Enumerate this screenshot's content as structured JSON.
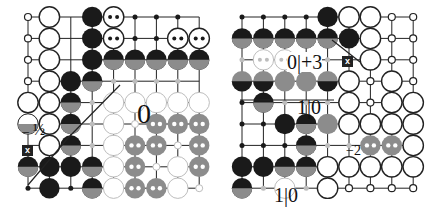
{
  "diagrams": [
    {
      "name": "left-go-diagram",
      "origin": [
        28,
        17
      ],
      "spacing": 21.4,
      "cols": 9,
      "rows": 9,
      "stones": [
        {
          "c": 0,
          "r": 0,
          "t": "wdot"
        },
        {
          "c": 1,
          "r": 0,
          "t": "w"
        },
        {
          "c": 3,
          "r": 0,
          "t": "b"
        },
        {
          "c": 4,
          "r": 0,
          "t": "w2"
        },
        {
          "c": 5,
          "r": 0,
          "t": "bdot"
        },
        {
          "c": 6,
          "r": 0,
          "t": "bdot"
        },
        {
          "c": 7,
          "r": 0,
          "t": "bdot"
        },
        {
          "c": 0,
          "r": 1,
          "t": "wdot"
        },
        {
          "c": 1,
          "r": 1,
          "t": "w"
        },
        {
          "c": 3,
          "r": 1,
          "t": "b"
        },
        {
          "c": 4,
          "r": 1,
          "t": "w2"
        },
        {
          "c": 5,
          "r": 1,
          "t": "bdot"
        },
        {
          "c": 6,
          "r": 1,
          "t": "bdot"
        },
        {
          "c": 7,
          "r": 1,
          "t": "w2"
        },
        {
          "c": 8,
          "r": 1,
          "t": "w2"
        },
        {
          "c": 0,
          "r": 2,
          "t": "wdot"
        },
        {
          "c": 1,
          "r": 2,
          "t": "w"
        },
        {
          "c": 3,
          "r": 2,
          "t": "b"
        },
        {
          "c": 4,
          "r": 2,
          "t": "bg"
        },
        {
          "c": 5,
          "r": 2,
          "t": "bg"
        },
        {
          "c": 6,
          "r": 2,
          "t": "bg"
        },
        {
          "c": 7,
          "r": 2,
          "t": "bg"
        },
        {
          "c": 8,
          "r": 2,
          "t": "bg"
        },
        {
          "c": 0,
          "r": 3,
          "t": "wdot"
        },
        {
          "c": 1,
          "r": 3,
          "t": "w"
        },
        {
          "c": 2,
          "r": 3,
          "t": "b"
        },
        {
          "c": 3,
          "r": 3,
          "t": "bg"
        },
        {
          "c": 4,
          "r": 3,
          "t": "gdot"
        },
        {
          "c": 5,
          "r": 3,
          "t": "gdot"
        },
        {
          "c": 6,
          "r": 3,
          "t": "gdot"
        },
        {
          "c": 7,
          "r": 3,
          "t": "gdot"
        },
        {
          "c": 0,
          "r": 4,
          "t": "w"
        },
        {
          "c": 1,
          "r": 4,
          "t": "w"
        },
        {
          "c": 2,
          "r": 4,
          "t": "bg"
        },
        {
          "c": 3,
          "r": 4,
          "t": "gdot"
        },
        {
          "c": 4,
          "r": 4,
          "t": "lw"
        },
        {
          "c": 5,
          "r": 4,
          "t": "lw"
        },
        {
          "c": 6,
          "r": 4,
          "t": "lw"
        },
        {
          "c": 7,
          "r": 4,
          "t": "lw"
        },
        {
          "c": 8,
          "r": 4,
          "t": "lw"
        },
        {
          "c": 0,
          "r": 5,
          "t": "wg"
        },
        {
          "c": 1,
          "r": 5,
          "t": "w"
        },
        {
          "c": 2,
          "r": 5,
          "t": "bg"
        },
        {
          "c": 3,
          "r": 5,
          "t": "gdot"
        },
        {
          "c": 4,
          "r": 5,
          "t": "lw"
        },
        {
          "c": 5,
          "r": 5,
          "t": "lwdot"
        },
        {
          "c": 6,
          "r": 5,
          "t": "g2"
        },
        {
          "c": 7,
          "r": 5,
          "t": "g2"
        },
        {
          "c": 8,
          "r": 5,
          "t": "g2"
        },
        {
          "c": 1,
          "r": 6,
          "t": "w"
        },
        {
          "c": 2,
          "r": 6,
          "t": "bg"
        },
        {
          "c": 3,
          "r": 6,
          "t": "gdot"
        },
        {
          "c": 4,
          "r": 6,
          "t": "lw"
        },
        {
          "c": 5,
          "r": 6,
          "t": "g2"
        },
        {
          "c": 6,
          "r": 6,
          "t": "g2"
        },
        {
          "c": 7,
          "r": 6,
          "t": "lwdot"
        },
        {
          "c": 8,
          "r": 6,
          "t": "g2"
        },
        {
          "c": 0,
          "r": 7,
          "t": "bg"
        },
        {
          "c": 1,
          "r": 7,
          "t": "b"
        },
        {
          "c": 2,
          "r": 7,
          "t": "b"
        },
        {
          "c": 3,
          "r": 7,
          "t": "bg"
        },
        {
          "c": 4,
          "r": 7,
          "t": "lw"
        },
        {
          "c": 5,
          "r": 7,
          "t": "g2"
        },
        {
          "c": 6,
          "r": 7,
          "t": "lwdot"
        },
        {
          "c": 7,
          "r": 7,
          "t": "lw"
        },
        {
          "c": 8,
          "r": 7,
          "t": "g2"
        },
        {
          "c": 0,
          "r": 8,
          "t": "bdot"
        },
        {
          "c": 1,
          "r": 8,
          "t": "b"
        },
        {
          "c": 2,
          "r": 8,
          "t": "bdot"
        },
        {
          "c": 3,
          "r": 8,
          "t": "bg"
        },
        {
          "c": 4,
          "r": 8,
          "t": "lw"
        },
        {
          "c": 5,
          "r": 8,
          "t": "g2"
        },
        {
          "c": 6,
          "r": 8,
          "t": "g2"
        },
        {
          "c": 7,
          "r": 8,
          "t": "lw"
        },
        {
          "c": 8,
          "r": 8,
          "t": "lwdot"
        }
      ]
    },
    {
      "name": "right-go-diagram",
      "origin": [
        242,
        17
      ],
      "spacing": 21.4,
      "cols": 9,
      "rows": 9,
      "stones": [
        {
          "c": 0,
          "r": 0,
          "t": "bdot"
        },
        {
          "c": 1,
          "r": 0,
          "t": "bdot"
        },
        {
          "c": 2,
          "r": 0,
          "t": "bdot"
        },
        {
          "c": 3,
          "r": 0,
          "t": "bdot"
        },
        {
          "c": 4,
          "r": 0,
          "t": "b"
        },
        {
          "c": 5,
          "r": 0,
          "t": "w"
        },
        {
          "c": 6,
          "r": 0,
          "t": "w"
        },
        {
          "c": 7,
          "r": 0,
          "t": "wdot"
        },
        {
          "c": 8,
          "r": 0,
          "t": "wdot"
        },
        {
          "c": 0,
          "r": 1,
          "t": "bg"
        },
        {
          "c": 1,
          "r": 1,
          "t": "bg"
        },
        {
          "c": 2,
          "r": 1,
          "t": "bg"
        },
        {
          "c": 3,
          "r": 1,
          "t": "bg"
        },
        {
          "c": 4,
          "r": 1,
          "t": "bg"
        },
        {
          "c": 5,
          "r": 1,
          "t": "b"
        },
        {
          "c": 6,
          "r": 1,
          "t": "w"
        },
        {
          "c": 7,
          "r": 1,
          "t": "wdot"
        },
        {
          "c": 8,
          "r": 1,
          "t": "wdot"
        },
        {
          "c": 0,
          "r": 2,
          "t": "gdot"
        },
        {
          "c": 1,
          "r": 2,
          "t": "lw2"
        },
        {
          "c": 2,
          "r": 2,
          "t": "lw2"
        },
        {
          "c": 3,
          "r": 2,
          "t": "gdot"
        },
        {
          "c": 4,
          "r": 2,
          "t": "gdot"
        },
        {
          "c": 6,
          "r": 2,
          "t": "w"
        },
        {
          "c": 7,
          "r": 2,
          "t": "wdot"
        },
        {
          "c": 8,
          "r": 2,
          "t": "wdot"
        },
        {
          "c": 0,
          "r": 3,
          "t": "gb"
        },
        {
          "c": 1,
          "r": 3,
          "t": "gb"
        },
        {
          "c": 2,
          "r": 3,
          "t": "g"
        },
        {
          "c": 3,
          "r": 3,
          "t": "g"
        },
        {
          "c": 4,
          "r": 3,
          "t": "gb"
        },
        {
          "c": 5,
          "r": 3,
          "t": "w"
        },
        {
          "c": 6,
          "r": 3,
          "t": "wdot"
        },
        {
          "c": 7,
          "r": 3,
          "t": "w"
        },
        {
          "c": 8,
          "r": 3,
          "t": "wdot"
        },
        {
          "c": 0,
          "r": 4,
          "t": "bdot"
        },
        {
          "c": 1,
          "r": 4,
          "t": "bg"
        },
        {
          "c": 2,
          "r": 4,
          "t": "gdot"
        },
        {
          "c": 3,
          "r": 4,
          "t": "gdot"
        },
        {
          "c": 4,
          "r": 4,
          "t": "gdot"
        },
        {
          "c": 5,
          "r": 4,
          "t": "w"
        },
        {
          "c": 6,
          "r": 4,
          "t": "wdot"
        },
        {
          "c": 7,
          "r": 4,
          "t": "w"
        },
        {
          "c": 8,
          "r": 4,
          "t": "w"
        },
        {
          "c": 0,
          "r": 5,
          "t": "bdot"
        },
        {
          "c": 1,
          "r": 5,
          "t": "bdot"
        },
        {
          "c": 2,
          "r": 5,
          "t": "b"
        },
        {
          "c": 3,
          "r": 5,
          "t": "bg"
        },
        {
          "c": 4,
          "r": 5,
          "t": "g"
        },
        {
          "c": 5,
          "r": 5,
          "t": "w"
        },
        {
          "c": 6,
          "r": 5,
          "t": "w"
        },
        {
          "c": 7,
          "r": 5,
          "t": "w"
        },
        {
          "c": 8,
          "r": 5,
          "t": "w"
        },
        {
          "c": 0,
          "r": 6,
          "t": "bdot"
        },
        {
          "c": 1,
          "r": 6,
          "t": "bdot"
        },
        {
          "c": 2,
          "r": 6,
          "t": "bdot"
        },
        {
          "c": 3,
          "r": 6,
          "t": "bg"
        },
        {
          "c": 4,
          "r": 6,
          "t": "gdot"
        },
        {
          "c": 5,
          "r": 6,
          "t": "gdot"
        },
        {
          "c": 6,
          "r": 6,
          "t": "g2"
        },
        {
          "c": 7,
          "r": 6,
          "t": "g2"
        },
        {
          "c": 8,
          "r": 6,
          "t": "w"
        },
        {
          "c": 0,
          "r": 7,
          "t": "b"
        },
        {
          "c": 1,
          "r": 7,
          "t": "b"
        },
        {
          "c": 2,
          "r": 7,
          "t": "bg"
        },
        {
          "c": 3,
          "r": 7,
          "t": "bg"
        },
        {
          "c": 4,
          "r": 7,
          "t": "w"
        },
        {
          "c": 5,
          "r": 7,
          "t": "w"
        },
        {
          "c": 6,
          "r": 7,
          "t": "w"
        },
        {
          "c": 7,
          "r": 7,
          "t": "w"
        },
        {
          "c": 8,
          "r": 7,
          "t": "w"
        },
        {
          "c": 0,
          "r": 8,
          "t": "bg"
        },
        {
          "c": 1,
          "r": 8,
          "t": "gdot"
        },
        {
          "c": 2,
          "r": 8,
          "t": "lw"
        },
        {
          "c": 3,
          "r": 8,
          "t": "gdot"
        },
        {
          "c": 4,
          "r": 8,
          "t": "w"
        },
        {
          "c": 5,
          "r": 8,
          "t": "wdot"
        },
        {
          "c": 6,
          "r": 8,
          "t": "wdot"
        },
        {
          "c": 7,
          "r": 8,
          "t": "wdot"
        },
        {
          "c": 8,
          "r": 8,
          "t": "wdot"
        }
      ]
    }
  ],
  "labels": {
    "left_value_zero": "0",
    "left_minus": "−",
    "left_half": "½",
    "left_x_marker": "x",
    "right_value_0_plus3": "0|+3",
    "right_value_1_0_top": "1|0",
    "right_value_1_0_bottom": "1|0",
    "right_x_marker": "x",
    "right_value_minus2": "−2"
  },
  "colors": {
    "black": "#1a1a1a",
    "gray": "#8c8c8c",
    "light_gray": "#bdbdbd",
    "line": "#222222"
  }
}
